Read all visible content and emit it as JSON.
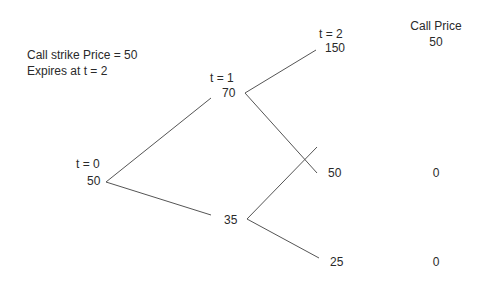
{
  "info": {
    "strike_line": "Call strike Price = 50",
    "expiry_line": "Expires at t = 2"
  },
  "tree": {
    "t0": {
      "time_label": "t = 0",
      "price": "50"
    },
    "t1": {
      "time_label": "t = 1",
      "up_price": "70",
      "down_price": "35"
    },
    "t2": {
      "time_label": "t = 2",
      "uu_price": "150",
      "ud_price": "50",
      "dd_price": "25"
    }
  },
  "call_price": {
    "header": "Call Price",
    "values": [
      "50",
      "0",
      "0"
    ]
  },
  "colors": {
    "line": "#555555",
    "text": "#2a2a2a"
  }
}
